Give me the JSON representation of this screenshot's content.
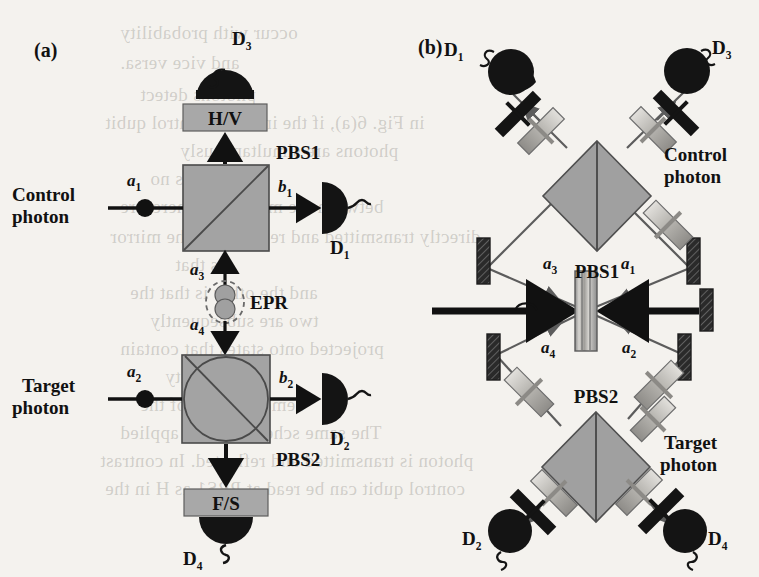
{
  "figure": {
    "background_color": "#f4f2ee",
    "ink_color": "#111111",
    "element_gray": "#9a9a9a",
    "element_gray_dark": "#6f6f6f",
    "detector_black": "#141414"
  },
  "panels": [
    {
      "id": "a",
      "label": "(a)"
    },
    {
      "id": "b",
      "label": "(b)"
    }
  ],
  "panel_a": {
    "panel_label": "(a)",
    "inputs": [
      {
        "name": "control",
        "line1": "Control",
        "line2": "photon",
        "mode": "a",
        "mode_sub": "1"
      },
      {
        "name": "target",
        "line1": "Target",
        "line2": "photon",
        "mode": "a",
        "mode_sub": "2"
      }
    ],
    "outputs": [
      {
        "name": "b1",
        "mode": "b",
        "mode_sub": "1"
      },
      {
        "name": "b2",
        "mode": "b",
        "mode_sub": "2"
      }
    ],
    "epr_modes": [
      {
        "name": "a3",
        "mode": "a",
        "mode_sub": "3"
      },
      {
        "name": "a4",
        "mode": "a",
        "mode_sub": "4"
      }
    ],
    "components": [
      {
        "name": "pbs1",
        "label": "PBS1"
      },
      {
        "name": "pbs2",
        "label": "PBS2"
      },
      {
        "name": "epr",
        "label": "EPR"
      },
      {
        "name": "hv-analyzer",
        "label": "H/V"
      },
      {
        "name": "fs-analyzer",
        "label": "F/S"
      }
    ],
    "detectors": [
      {
        "name": "d1",
        "label": "D",
        "sub": "1"
      },
      {
        "name": "d2",
        "label": "D",
        "sub": "2"
      },
      {
        "name": "d3",
        "label": "D",
        "sub": "3"
      },
      {
        "name": "d4",
        "label": "D",
        "sub": "4"
      }
    ]
  },
  "panel_b": {
    "panel_label": "(b)",
    "components": [
      {
        "name": "pbs1",
        "label": "PBS1"
      },
      {
        "name": "pbs2",
        "label": "PBS2"
      }
    ],
    "inputs": [
      {
        "name": "control",
        "line1": "Control",
        "line2": "photon"
      },
      {
        "name": "target",
        "line1": "Target",
        "line2": "photon"
      }
    ],
    "modes": [
      {
        "name": "a1",
        "mode": "a",
        "mode_sub": "1"
      },
      {
        "name": "a2",
        "mode": "a",
        "mode_sub": "2"
      },
      {
        "name": "a3",
        "mode": "a",
        "mode_sub": "3"
      },
      {
        "name": "a4",
        "mode": "a",
        "mode_sub": "4"
      }
    ],
    "detectors": [
      {
        "name": "d1",
        "label": "D",
        "sub": "1"
      },
      {
        "name": "d2",
        "label": "D",
        "sub": "2"
      },
      {
        "name": "d3",
        "label": "D",
        "sub": "3"
      },
      {
        "name": "d4",
        "label": "D",
        "sub": "4"
      }
    ]
  },
  "background_bleed_text": [
    {
      "text": "occur with probability",
      "x": 120,
      "y": 22
    },
    {
      "text": "and vice versa.",
      "x": 120,
      "y": 52
    },
    {
      "text": "photons detect",
      "x": 140,
      "y": 84
    },
    {
      "text": "in Fig. 6(a), if the incident control qubit",
      "x": 105,
      "y": 112
    },
    {
      "text": "photons  are  simultaneously",
      "x": 180,
      "y": 140
    },
    {
      "text": "there is no",
      "x": 150,
      "y": 168
    },
    {
      "text": "between the modes and therefore",
      "x": 120,
      "y": 196
    },
    {
      "text": "directly transmitted and reflected at the mirror",
      "x": 110,
      "y": 226
    },
    {
      "text": "is that",
      "x": 175,
      "y": 254
    },
    {
      "text": "and the other is that the",
      "x": 130,
      "y": 282
    },
    {
      "text": "two are subsequently",
      "x": 150,
      "y": 310
    },
    {
      "text": "projected onto states that contain",
      "x": 120,
      "y": 338
    },
    {
      "text": "probability",
      "x": 165,
      "y": 366
    },
    {
      "text": "demonstration of the",
      "x": 140,
      "y": 394
    },
    {
      "text": "The same scheme can be applied",
      "x": 120,
      "y": 422
    },
    {
      "text": "photon is transmitted and reflected. In contrast",
      "x": 100,
      "y": 450
    },
    {
      "text": "control qubit can be read at PBS1 as H in the",
      "x": 105,
      "y": 478
    }
  ]
}
